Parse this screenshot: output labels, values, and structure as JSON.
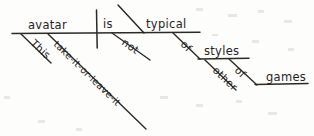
{
  "diagram": {
    "type": "reed-kellogg-sentence-diagram",
    "sentence": "This take-it-or-leave-it avatar is not typical of other styles of games.",
    "ink_color": "#2c2a25",
    "background_color": "#fdfdfc",
    "width": 314,
    "height": 136,
    "nodes": {
      "subject": "avatar",
      "verb": "is",
      "adverb": "not",
      "predicate_adjective": "typical",
      "subject_modifier_1": "This",
      "subject_modifier_2": "take-it-or-leave-it",
      "preposition_1": "of",
      "object_of_preposition_1": "styles",
      "object_modifier": "other",
      "preposition_2": "of",
      "object_of_preposition_2": "games"
    }
  }
}
